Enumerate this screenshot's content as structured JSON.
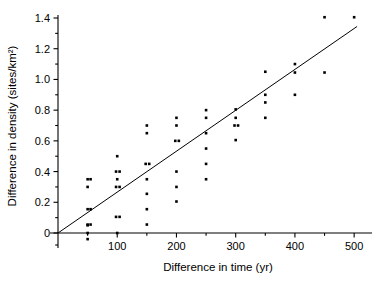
{
  "chart_data": {
    "type": "scatter",
    "title": "",
    "xlabel": "Difference in time (yr)",
    "ylabel": "Difference in density (sites/km²)",
    "xlim": [
      0,
      520
    ],
    "ylim": [
      -0.06,
      1.45
    ],
    "xticks": [
      100,
      200,
      300,
      400,
      500
    ],
    "xticklabels": [
      "100",
      "200",
      "300",
      "400",
      "500"
    ],
    "yticks": [
      0,
      0.2,
      0.4,
      0.6,
      0.8,
      1.0,
      1.2,
      1.4
    ],
    "yticklabels": [
      "0",
      "0.2",
      "0.4",
      "0.6",
      "0.8",
      "1.0",
      "1.2",
      "1.4"
    ],
    "xminorticks": [
      50,
      150,
      250,
      350,
      450
    ],
    "yminorticks": [
      0.1,
      0.3,
      0.5,
      0.7,
      0.9,
      1.1,
      1.3
    ],
    "grid": false,
    "legend": null,
    "marker": "square",
    "marker_color": "#000000",
    "points": [
      {
        "x": 50,
        "y": -0.04
      },
      {
        "x": 50,
        "y": 0.0
      },
      {
        "x": 50,
        "y": 0.05
      },
      {
        "x": 50,
        "y": 0.055
      },
      {
        "x": 55,
        "y": 0.055
      },
      {
        "x": 50,
        "y": 0.155
      },
      {
        "x": 55,
        "y": 0.155
      },
      {
        "x": 50,
        "y": 0.3
      },
      {
        "x": 50,
        "y": 0.35
      },
      {
        "x": 55,
        "y": 0.35
      },
      {
        "x": 100,
        "y": 0.0
      },
      {
        "x": 98,
        "y": 0.105
      },
      {
        "x": 104,
        "y": 0.105
      },
      {
        "x": 98,
        "y": 0.3
      },
      {
        "x": 104,
        "y": 0.3
      },
      {
        "x": 100,
        "y": 0.35
      },
      {
        "x": 98,
        "y": 0.4
      },
      {
        "x": 104,
        "y": 0.4
      },
      {
        "x": 100,
        "y": 0.5
      },
      {
        "x": 150,
        "y": 0.055
      },
      {
        "x": 150,
        "y": 0.155
      },
      {
        "x": 150,
        "y": 0.255
      },
      {
        "x": 150,
        "y": 0.35
      },
      {
        "x": 148,
        "y": 0.45
      },
      {
        "x": 154,
        "y": 0.45
      },
      {
        "x": 150,
        "y": 0.65
      },
      {
        "x": 150,
        "y": 0.7
      },
      {
        "x": 200,
        "y": 0.205
      },
      {
        "x": 200,
        "y": 0.3
      },
      {
        "x": 200,
        "y": 0.4
      },
      {
        "x": 198,
        "y": 0.6
      },
      {
        "x": 204,
        "y": 0.6
      },
      {
        "x": 200,
        "y": 0.7
      },
      {
        "x": 200,
        "y": 0.75
      },
      {
        "x": 250,
        "y": 0.35
      },
      {
        "x": 250,
        "y": 0.45
      },
      {
        "x": 250,
        "y": 0.55
      },
      {
        "x": 250,
        "y": 0.65
      },
      {
        "x": 250,
        "y": 0.75
      },
      {
        "x": 250,
        "y": 0.8
      },
      {
        "x": 300,
        "y": 0.605
      },
      {
        "x": 298,
        "y": 0.7
      },
      {
        "x": 304,
        "y": 0.7
      },
      {
        "x": 300,
        "y": 0.75
      },
      {
        "x": 300,
        "y": 0.805
      },
      {
        "x": 350,
        "y": 0.75
      },
      {
        "x": 350,
        "y": 0.85
      },
      {
        "x": 350,
        "y": 0.9
      },
      {
        "x": 350,
        "y": 1.05
      },
      {
        "x": 400,
        "y": 0.9
      },
      {
        "x": 400,
        "y": 1.045
      },
      {
        "x": 400,
        "y": 1.1
      },
      {
        "x": 450,
        "y": 1.045
      },
      {
        "x": 450,
        "y": 1.405
      },
      {
        "x": 500,
        "y": 1.405
      }
    ],
    "fit_line": {
      "type": "linear-regression",
      "x_start": 0,
      "y_start": 0.0,
      "x_end": 505,
      "y_end": 1.345
    }
  }
}
